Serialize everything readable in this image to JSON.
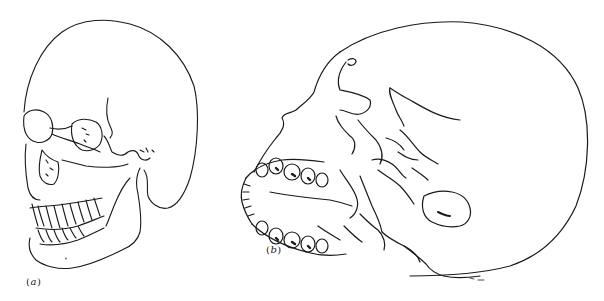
{
  "figure": {
    "type": "anatomical line drawing",
    "line_color": "#1a1a1a",
    "background": "#ffffff",
    "panels": [
      {
        "id": "a",
        "label": "(a)",
        "label_open": "(",
        "label_letter": "a",
        "label_close": ")",
        "view": "anterior-oblique view of skull"
      },
      {
        "id": "b",
        "label": "(b)",
        "label_open": "(",
        "label_letter": "b",
        "label_close": ")",
        "view": "inferior (basal) oblique view of skull"
      }
    ]
  }
}
